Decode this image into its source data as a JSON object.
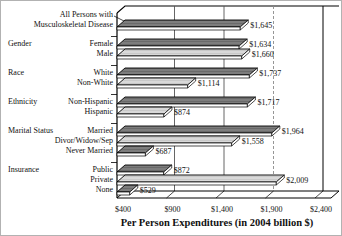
{
  "frame": {
    "background": "#ffffff",
    "border_color": "#b2b2b2"
  },
  "chart_data": {
    "type": "bar",
    "orientation": "horizontal",
    "style": "3d-ribbon",
    "title": "",
    "xlabel": "Per Person Expenditures (in 2004 billion $)",
    "ylabel": "",
    "x_axis": {
      "min": 400,
      "max": 2400,
      "tick_values": [
        400,
        900,
        1400,
        1900,
        2400
      ],
      "tick_labels": [
        "$400",
        "$900",
        "$1,400",
        "$1,900",
        "$2,400"
      ]
    },
    "grid": "vertical-gridlines-on-back-wall",
    "legend": "none",
    "colors": {
      "dark_bar": "#7d7d7d",
      "dark_bar_texture": "#6a6a6a",
      "light_bar": "#d9d9d9",
      "light_bar_texture": "#c9c9c9",
      "bar_edge_face": "#ffffff",
      "outline": "#000000",
      "gridline": "#555555",
      "gridline_dashed": "#8a8a8a",
      "text": "#111111"
    },
    "groups": [
      {
        "label": "",
        "items": [
          {
            "label": "All Persons with\nMusculoskeletal Disease",
            "value": 1645,
            "value_label": "$1,645",
            "shade": "dark"
          }
        ]
      },
      {
        "label": "Gender",
        "items": [
          {
            "label": "Female",
            "value": 1634,
            "value_label": "$1,634",
            "shade": "dark"
          },
          {
            "label": "Male",
            "value": 1660,
            "value_label": "$1,660",
            "shade": "light"
          }
        ]
      },
      {
        "label": "Race",
        "items": [
          {
            "label": "White",
            "value": 1737,
            "value_label": "$1,737",
            "shade": "dark"
          },
          {
            "label": "Non-White",
            "value": 1114,
            "value_label": "$1,114",
            "shade": "light"
          }
        ]
      },
      {
        "label": "Ethnicity",
        "items": [
          {
            "label": "Non-Hispanic",
            "value": 1717,
            "value_label": "$1,717",
            "shade": "dark"
          },
          {
            "label": "Hispanic",
            "value": 874,
            "value_label": "$874",
            "shade": "light"
          }
        ]
      },
      {
        "label": "Marital Status",
        "items": [
          {
            "label": "Married",
            "value": 1964,
            "value_label": "$1,964",
            "shade": "dark"
          },
          {
            "label": "Divor/Widow/Sep",
            "value": 1558,
            "value_label": "$1,558",
            "shade": "light"
          },
          {
            "label": "Never Married",
            "value": 687,
            "value_label": "$687",
            "shade": "dark"
          }
        ]
      },
      {
        "label": "Insurance",
        "items": [
          {
            "label": "Public",
            "value": 872,
            "value_label": "$872",
            "shade": "dark"
          },
          {
            "label": "Private",
            "value": 2009,
            "value_label": "$2,009",
            "shade": "light"
          },
          {
            "label": "None",
            "value": 529,
            "value_label": "$529",
            "shade": "dark"
          }
        ]
      }
    ]
  }
}
